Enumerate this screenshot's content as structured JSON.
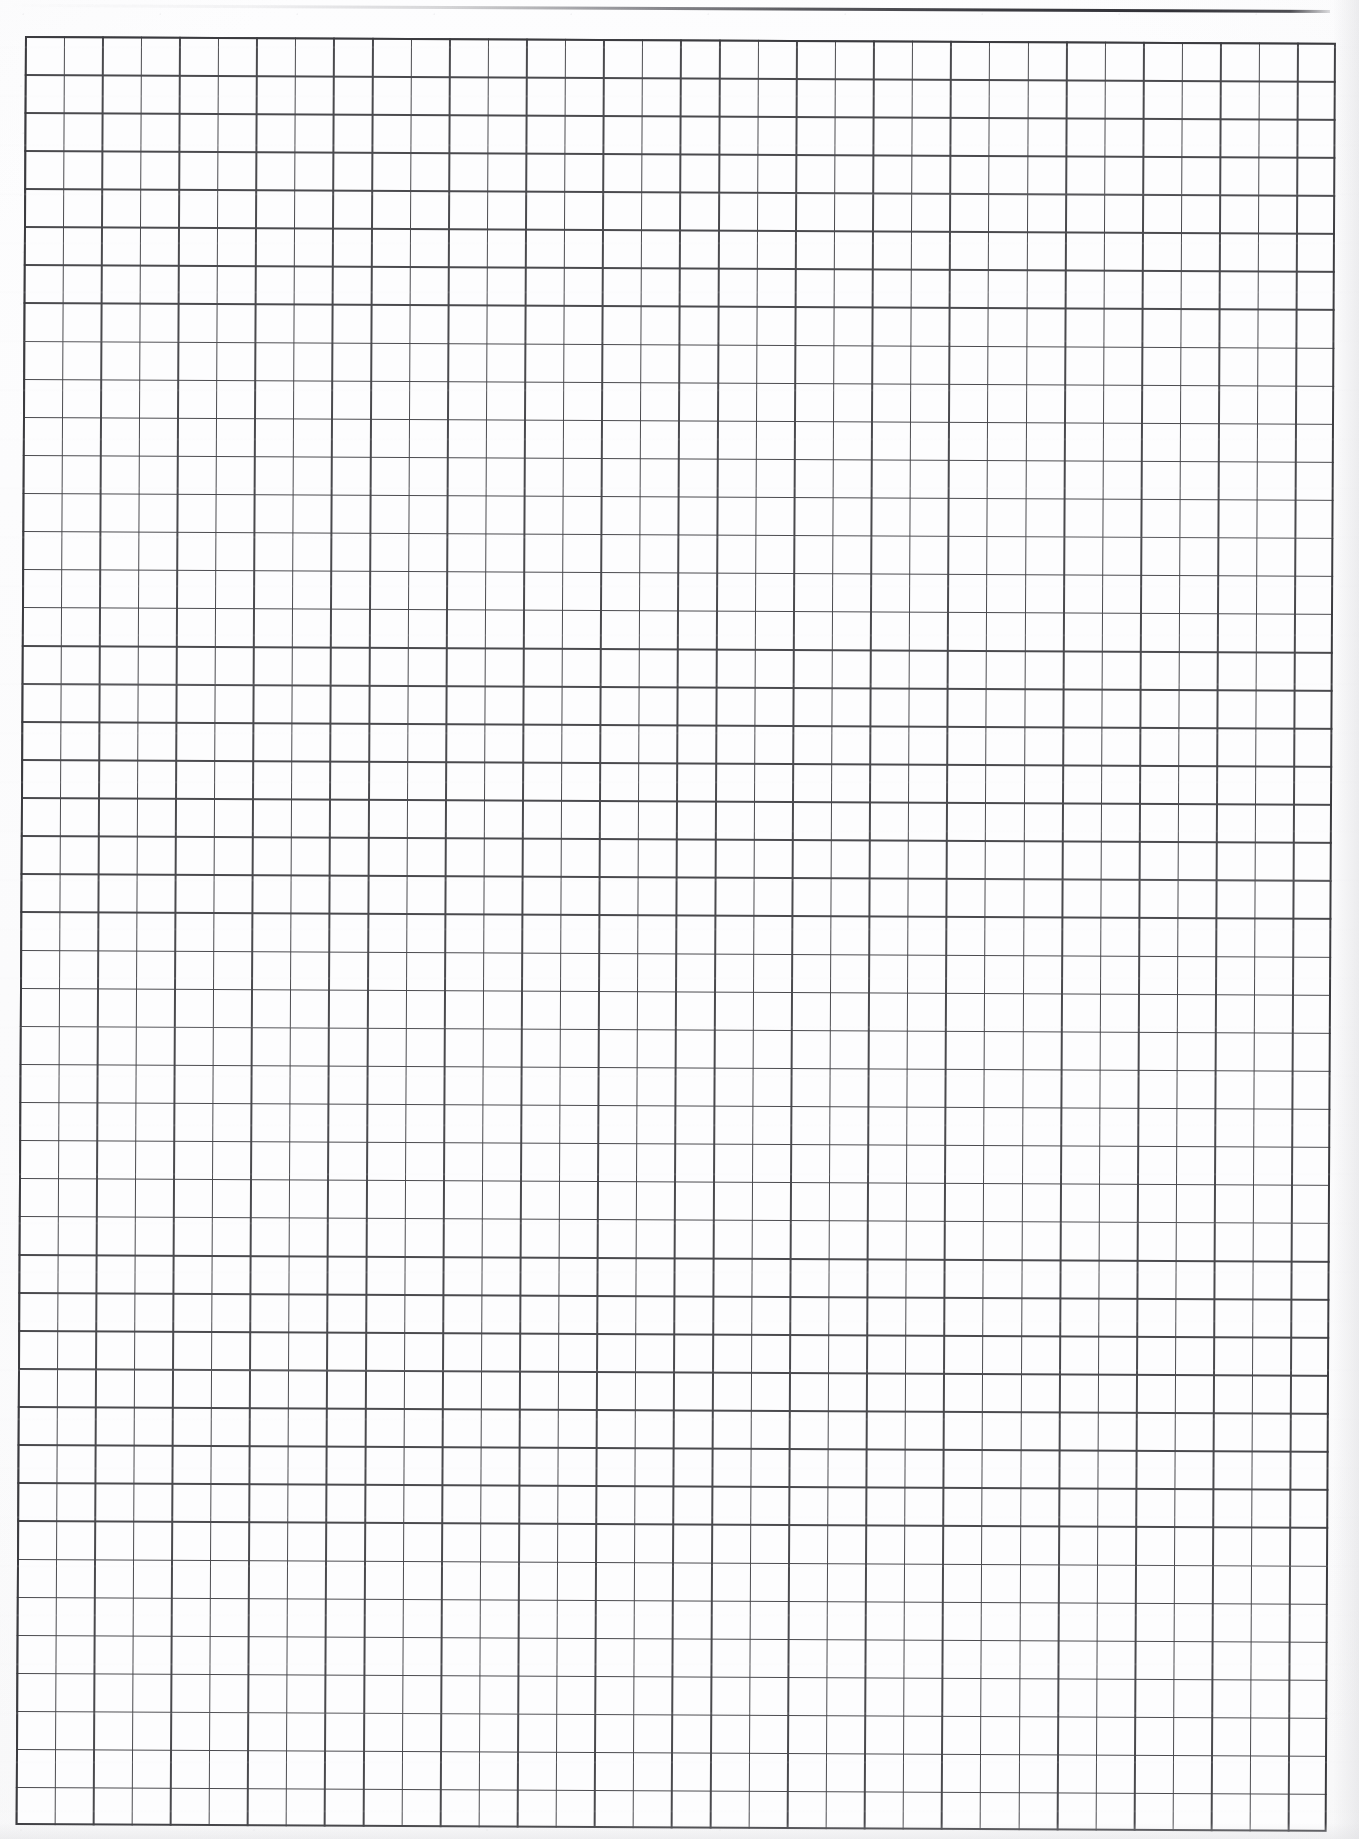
{
  "document": {
    "kind": "scanned-graph-paper",
    "page_label": "",
    "width_px": 1359,
    "height_px": 1839,
    "background_color": "#fcfcfd"
  },
  "grid": {
    "name": "graph-paper-grid",
    "origin_x_px": 25,
    "origin_y_px": 36,
    "width_px": 1311,
    "height_px": 1789,
    "columns": 34,
    "rows": 47,
    "cell_width_px": 38.6,
    "cell_height_px": 38.1,
    "line_color": "#4a4a4e",
    "line_width_px": 1.5,
    "border_color": "#3b3b3f",
    "border_width_px": 2.4,
    "skew_degrees": 0.3,
    "cell_fill_color": "#fdfdfe"
  },
  "artifacts": {
    "top_edge_line": {
      "name": "scan-edge-line",
      "color": "#3c3c42",
      "start_x_px": 8,
      "end_x_px": 1330,
      "start_y_px": 4,
      "end_y_px": 10,
      "thickness_px": 3,
      "description": "dark slanted page-edge line from scanner"
    }
  },
  "text_content": {
    "has_text": false,
    "items": []
  }
}
